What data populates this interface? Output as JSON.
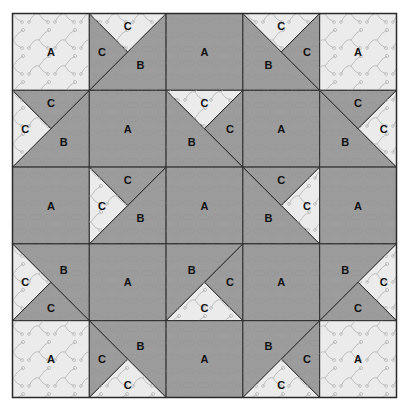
{
  "colors": {
    "dark": "#9c9c9c",
    "light": "#ebebeb",
    "line": "#2a2a2a",
    "dark_pattern": "#b0b0b0",
    "light_pattern": "#c8c8c8"
  },
  "legend_pieces": [
    "A",
    "B",
    "C"
  ],
  "grid": [
    [
      {
        "type": "square",
        "label": "A",
        "shade": "light"
      },
      {
        "type": "hst",
        "diag": "bl-tr",
        "b_side": "br",
        "b_shade": "dark",
        "c1": {
          "side": "left",
          "shade": "dark",
          "label": "C"
        },
        "c2": {
          "side": "top",
          "shade": "light",
          "label": "C"
        },
        "label": "B"
      },
      {
        "type": "square",
        "label": "A",
        "shade": "dark"
      },
      {
        "type": "hst",
        "diag": "tl-br",
        "b_side": "bl",
        "b_shade": "dark",
        "c1": {
          "side": "top",
          "shade": "light",
          "label": "C"
        },
        "c2": {
          "side": "right",
          "shade": "dark",
          "label": "C"
        },
        "label": "B"
      },
      {
        "type": "square",
        "label": "A",
        "shade": "light"
      }
    ],
    [
      {
        "type": "hst",
        "diag": "bl-tr",
        "b_side": "br",
        "b_shade": "dark",
        "c1": {
          "side": "top",
          "shade": "dark",
          "label": "C"
        },
        "c2": {
          "side": "left",
          "shade": "light",
          "label": "C"
        },
        "label": "B"
      },
      {
        "type": "square",
        "label": "A",
        "shade": "dark"
      },
      {
        "type": "hst",
        "diag": "tl-br",
        "b_side": "bl",
        "b_shade": "dark",
        "c1": {
          "side": "top",
          "shade": "light",
          "label": "C"
        },
        "c2": {
          "side": "right",
          "shade": "dark",
          "label": "C"
        },
        "label": "B"
      },
      {
        "type": "square",
        "label": "A",
        "shade": "dark"
      },
      {
        "type": "hst",
        "diag": "tl-br",
        "b_side": "bl",
        "b_shade": "dark",
        "c1": {
          "side": "top",
          "shade": "dark",
          "label": "C"
        },
        "c2": {
          "side": "right",
          "shade": "light",
          "label": "C"
        },
        "label": "B"
      }
    ],
    [
      {
        "type": "square",
        "label": "A",
        "shade": "dark"
      },
      {
        "type": "hst",
        "diag": "bl-tr",
        "b_side": "br",
        "b_shade": "dark",
        "c1": {
          "side": "top",
          "shade": "dark",
          "label": "C"
        },
        "c2": {
          "side": "left",
          "shade": "light",
          "label": "C"
        },
        "label": "B"
      },
      {
        "type": "square",
        "label": "A",
        "shade": "dark"
      },
      {
        "type": "hst",
        "diag": "tl-br",
        "b_side": "bl",
        "b_shade": "dark",
        "c1": {
          "side": "top",
          "shade": "dark",
          "label": "C"
        },
        "c2": {
          "side": "right",
          "shade": "light",
          "label": "C"
        },
        "label": "B"
      },
      {
        "type": "square",
        "label": "A",
        "shade": "dark"
      }
    ],
    [
      {
        "type": "hst",
        "diag": "tl-br",
        "b_side": "tr",
        "b_shade": "dark",
        "c1": {
          "side": "left",
          "shade": "light",
          "label": "C"
        },
        "c2": {
          "side": "bottom",
          "shade": "dark",
          "label": "C"
        },
        "label": "B"
      },
      {
        "type": "square",
        "label": "A",
        "shade": "dark"
      },
      {
        "type": "hst",
        "diag": "bl-tr",
        "b_side": "tl",
        "b_shade": "dark",
        "c1": {
          "side": "right",
          "shade": "dark",
          "label": "C"
        },
        "c2": {
          "side": "bottom",
          "shade": "light",
          "label": "C"
        },
        "label": "B"
      },
      {
        "type": "square",
        "label": "A",
        "shade": "dark"
      },
      {
        "type": "hst",
        "diag": "bl-tr",
        "b_side": "tl",
        "b_shade": "dark",
        "c1": {
          "side": "right",
          "shade": "light",
          "label": "C"
        },
        "c2": {
          "side": "bottom",
          "shade": "dark",
          "label": "C"
        },
        "label": "B"
      }
    ],
    [
      {
        "type": "square",
        "label": "A",
        "shade": "light"
      },
      {
        "type": "hst",
        "diag": "tl-br",
        "b_side": "tr",
        "b_shade": "dark",
        "c1": {
          "side": "left",
          "shade": "dark",
          "label": "C"
        },
        "c2": {
          "side": "bottom",
          "shade": "light",
          "label": "C"
        },
        "label": "B"
      },
      {
        "type": "square",
        "label": "A",
        "shade": "dark"
      },
      {
        "type": "hst",
        "diag": "bl-tr",
        "b_side": "tl",
        "b_shade": "dark",
        "c1": {
          "side": "right",
          "shade": "dark",
          "label": "C"
        },
        "c2": {
          "side": "bottom",
          "shade": "light",
          "label": "C"
        },
        "label": "B"
      },
      {
        "type": "square",
        "label": "A",
        "shade": "light"
      }
    ]
  ]
}
